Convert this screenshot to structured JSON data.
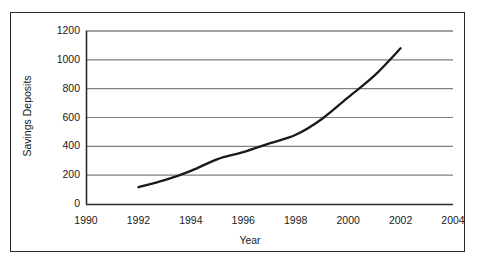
{
  "chart_data": {
    "type": "line",
    "title": "",
    "xlabel": "Year",
    "ylabel": "Savings Deposits",
    "xlim": [
      1990,
      2004
    ],
    "ylim": [
      0,
      1200
    ],
    "xticks": [
      "1990",
      "1992",
      "1994",
      "1996",
      "1998",
      "2000",
      "2002",
      "2004"
    ],
    "yticks": [
      "0",
      "200",
      "400",
      "600",
      "800",
      "1000",
      "1200"
    ],
    "grid": "horizontal",
    "legend": "none",
    "line_color": "#1a1a1a",
    "grid_color": "#808080",
    "axis_color": "#2b2b2b",
    "background": "#ffffff",
    "series": [
      {
        "name": "Savings Deposits",
        "x": [
          1992,
          1993,
          1994,
          1995,
          1996,
          1997,
          1998,
          1999,
          2000,
          2001,
          2002
        ],
        "values": [
          117,
          165,
          230,
          310,
          360,
          420,
          480,
          590,
          740,
          890,
          1080
        ]
      }
    ]
  },
  "axes": {
    "y_title": "Savings Deposits",
    "x_title": "Year",
    "y_ticks": [
      {
        "label": "1200",
        "value": 1200
      },
      {
        "label": "1000",
        "value": 1000
      },
      {
        "label": "800",
        "value": 800
      },
      {
        "label": "600",
        "value": 600
      },
      {
        "label": "400",
        "value": 400
      },
      {
        "label": "200",
        "value": 200
      },
      {
        "label": "0",
        "value": 0
      }
    ],
    "x_ticks": [
      {
        "label": "1990",
        "value": 1990
      },
      {
        "label": "1992",
        "value": 1992
      },
      {
        "label": "1994",
        "value": 1994
      },
      {
        "label": "1996",
        "value": 1996
      },
      {
        "label": "1998",
        "value": 1998
      },
      {
        "label": "2000",
        "value": 2000
      },
      {
        "label": "2002",
        "value": 2002
      },
      {
        "label": "2004",
        "value": 2004
      }
    ]
  }
}
